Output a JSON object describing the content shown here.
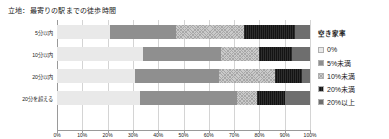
{
  "chart_data": {
    "type": "bar",
    "title": "立地：最寄りの駅までの徒歩時間",
    "orientation": "horizontal",
    "stacked": true,
    "stack_mode": "percent",
    "xlabel": "",
    "ylabel": "",
    "xlim": [
      0,
      100
    ],
    "grid": true,
    "legend_position": "right",
    "legend_title": "空き家率",
    "categories": [
      "5分以内",
      "10分以内",
      "20分以内",
      "20分を超える"
    ],
    "xticks": [
      "0%",
      "10%",
      "20%",
      "30%",
      "40%",
      "50%",
      "60%",
      "70%",
      "80%",
      "90%",
      "100%"
    ],
    "xtick_values": [
      0,
      10,
      20,
      30,
      40,
      50,
      60,
      70,
      80,
      90,
      100
    ],
    "series": [
      {
        "name": "0%",
        "values": [
          21,
          34,
          31,
          33
        ]
      },
      {
        "name": "5%未満",
        "values": [
          26,
          31,
          33,
          38
        ]
      },
      {
        "name": "10%未満",
        "values": [
          27,
          15,
          22,
          8
        ]
      },
      {
        "name": "20%未満",
        "values": [
          20,
          13,
          11,
          11
        ]
      },
      {
        "name": "20%以上",
        "values": [
          6,
          7,
          3,
          10
        ]
      }
    ]
  },
  "colors": {
    "series_0": "#e9e9e9",
    "series_1": "#8f8f8f",
    "series_2": "#cacaca",
    "series_3": "#141414",
    "series_4": "#6e6e6e",
    "gridline": "#d4d4d4",
    "axis": "#9a9a9a",
    "text": "#1a1a1a",
    "background": "#ffffff"
  }
}
